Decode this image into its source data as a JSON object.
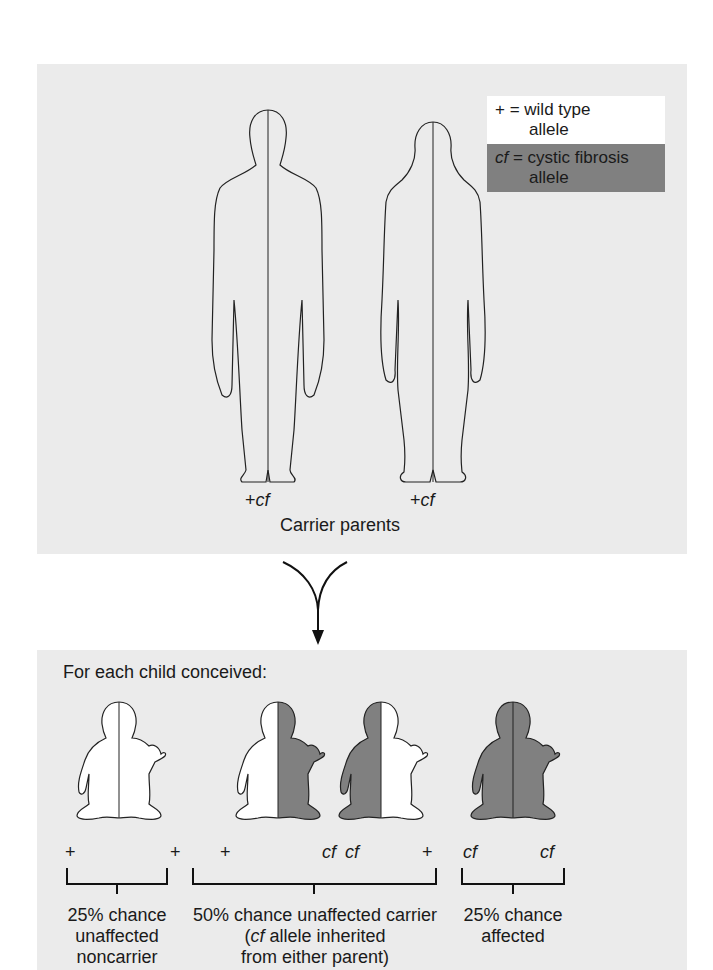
{
  "legend": {
    "wild_type_symbol": "+",
    "wild_type_eq": " = wild type",
    "wild_type_line2": "allele",
    "cf_symbol": "cf",
    "cf_eq": " = cystic fibrosis",
    "cf_line2": "allele"
  },
  "parents": {
    "father_genotype": {
      "plus": "+",
      "cf": "cf"
    },
    "mother_genotype": {
      "plus": "+",
      "cf": "cf"
    },
    "caption": "Carrier parents"
  },
  "children": {
    "heading": "For each child conceived:",
    "genotypes": [
      {
        "left": "+",
        "right": "+"
      },
      {
        "left": "+",
        "right": "cf"
      },
      {
        "left": "cf",
        "right": "+"
      },
      {
        "left": "cf",
        "right": "cf"
      }
    ],
    "outcomes": [
      {
        "line1": "25% chance",
        "line2": "unaffected",
        "line3": "noncarrier"
      },
      {
        "line1": "50% chance unaffected carrier",
        "line2_italic": "cf",
        "line2_rest": " allele inherited",
        "line3": "from either parent)",
        "line2_prefix": "("
      },
      {
        "line1": "25% chance",
        "line2": "affected"
      }
    ]
  },
  "colors": {
    "wild_type": "#ffffff",
    "cf_allele": "#808080",
    "panel": "#ebebeb"
  }
}
